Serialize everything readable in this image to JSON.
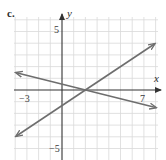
{
  "part_label": "c.",
  "chart_data": {
    "type": "line",
    "title": "",
    "xlabel": "x",
    "ylabel": "y",
    "xlim": [
      -4,
      8
    ],
    "ylim": [
      -6,
      6
    ],
    "grid": true,
    "tick_labels": {
      "x": [
        {
          "value": -3,
          "label": "−3"
        },
        {
          "value": 7,
          "label": "7"
        }
      ],
      "y": [
        {
          "value": 5,
          "label": "5"
        },
        {
          "value": -5,
          "label": "−5"
        }
      ]
    },
    "series": [
      {
        "name": "line-decreasing",
        "equation": "y = -x/4 + 1/2",
        "x": [
          -3.9,
          8.0
        ],
        "y": [
          1.475,
          -1.5
        ],
        "arrows": "both"
      },
      {
        "name": "line-increasing",
        "equation": "y = 2x/3 - 4/3",
        "x": [
          -3.9,
          7.9
        ],
        "y": [
          -3.93,
          3.93
        ],
        "arrows": "both"
      }
    ],
    "intersection": {
      "x": 2,
      "y": 0
    },
    "colors": {
      "grid": "#d9d9d9",
      "axes": "#3a3a3a",
      "lines": "#6e6e6e"
    }
  }
}
